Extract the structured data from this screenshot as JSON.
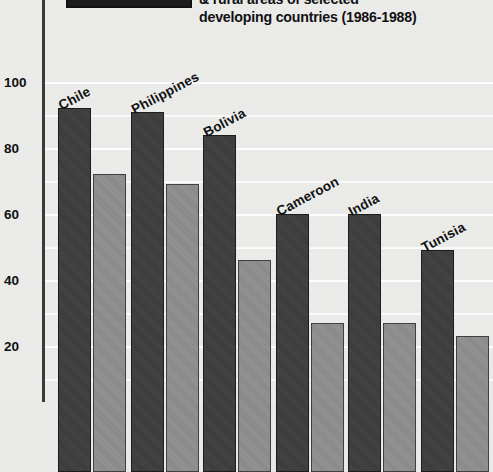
{
  "legend": {
    "swatch_name": "urban-legend-swatch",
    "cropped_note": "legend label cropped above image top"
  },
  "title": {
    "line1": "& rural areas of selected",
    "line2": "developing countries (1986-1988)"
  },
  "colors": {
    "urban_bar": "#3d3d3d",
    "rural_bar": "#8d8d8d",
    "background": "#ececeb",
    "gridline": "#fdfdfd",
    "axis": "#3a3a3a",
    "text": "#111111"
  },
  "chart_data": {
    "type": "bar",
    "title": "& rural areas of selected developing countries (1986-1988)",
    "xlabel": "",
    "ylabel": "",
    "ylim": [
      0,
      100
    ],
    "yticks": [
      20,
      40,
      60,
      80,
      100
    ],
    "ytick_labels": [
      "20",
      "40",
      "60",
      "80",
      "100"
    ],
    "grid": true,
    "grid_minor_step": 10,
    "legend_position": "top-left",
    "categories": [
      "Chile",
      "Philippines",
      "Bolivia",
      "Cameroon",
      "India",
      "Tunisia"
    ],
    "series": [
      {
        "name": "urban",
        "values": [
          92,
          91,
          84,
          60,
          60,
          49
        ]
      },
      {
        "name": "rural",
        "values": [
          72,
          69,
          46,
          27,
          27,
          23
        ]
      }
    ]
  }
}
